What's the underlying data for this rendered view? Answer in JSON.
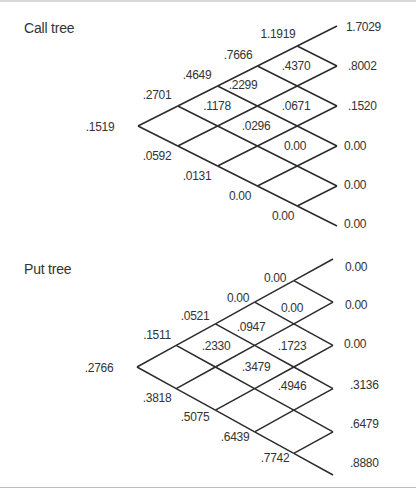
{
  "call_tree": {
    "title": "Call tree",
    "title_pos": {
      "x": 24,
      "y": 20
    },
    "geometry": {
      "root_x": 138,
      "root_y": 126,
      "dx": 39.8,
      "dy": 20,
      "steps": 5
    },
    "labels": [
      {
        "text": ".1519",
        "x": 100,
        "y": 131,
        "anchor": "middle"
      },
      {
        "text": ".2701",
        "x": 157,
        "y": 99,
        "anchor": "middle"
      },
      {
        "text": ".0592",
        "x": 157,
        "y": 160,
        "anchor": "middle"
      },
      {
        "text": ".4649",
        "x": 197,
        "y": 79,
        "anchor": "middle"
      },
      {
        "text": ".1178",
        "x": 217,
        "y": 110,
        "anchor": "middle"
      },
      {
        "text": ".0131",
        "x": 197,
        "y": 180,
        "anchor": "middle"
      },
      {
        "text": ".7666",
        "x": 238,
        "y": 59,
        "anchor": "middle"
      },
      {
        "text": ".2299",
        "x": 243,
        "y": 89,
        "anchor": "middle"
      },
      {
        "text": ".0296",
        "x": 256,
        "y": 130,
        "anchor": "middle"
      },
      {
        "text": "0.00",
        "x": 240,
        "y": 200,
        "anchor": "middle"
      },
      {
        "text": "1.1919",
        "x": 278,
        "y": 38,
        "anchor": "middle"
      },
      {
        "text": ".4370",
        "x": 296,
        "y": 70,
        "anchor": "middle"
      },
      {
        "text": ".0671",
        "x": 296,
        "y": 110,
        "anchor": "middle"
      },
      {
        "text": "0.00",
        "x": 295,
        "y": 150,
        "anchor": "middle"
      },
      {
        "text": "0.00",
        "x": 283,
        "y": 220,
        "anchor": "middle"
      }
    ],
    "terminals": [
      {
        "text": "1.7029",
        "x": 346,
        "y": 31
      },
      {
        "text": ".8002",
        "x": 348,
        "y": 70
      },
      {
        "text": ".1520",
        "x": 348,
        "y": 110
      },
      {
        "text": "0.00",
        "x": 344,
        "y": 150
      },
      {
        "text": "0.00",
        "x": 344,
        "y": 189
      },
      {
        "text": "0.00",
        "x": 344,
        "y": 228
      }
    ]
  },
  "put_tree": {
    "title": "Put tree",
    "title_pos": {
      "x": 24,
      "y": 272
    },
    "geometry": {
      "root_x": 137,
      "root_y": 367,
      "dx": 39.2,
      "dy": 21.6,
      "steps": 5
    },
    "labels": [
      {
        "text": ".2766",
        "x": 99,
        "y": 372,
        "anchor": "middle"
      },
      {
        "text": ".1511",
        "x": 157,
        "y": 339,
        "anchor": "middle"
      },
      {
        "text": ".3818",
        "x": 157,
        "y": 402,
        "anchor": "middle"
      },
      {
        "text": ".0521",
        "x": 195,
        "y": 320,
        "anchor": "middle"
      },
      {
        "text": ".2330",
        "x": 216,
        "y": 350,
        "anchor": "middle"
      },
      {
        "text": ".5075",
        "x": 195,
        "y": 421,
        "anchor": "middle"
      },
      {
        "text": "0.00",
        "x": 238,
        "y": 302,
        "anchor": "middle"
      },
      {
        "text": ".0947",
        "x": 251,
        "y": 331,
        "anchor": "middle"
      },
      {
        "text": ".3479",
        "x": 256,
        "y": 371,
        "anchor": "middle"
      },
      {
        "text": ".6439",
        "x": 235,
        "y": 441,
        "anchor": "middle"
      },
      {
        "text": "0.00",
        "x": 275,
        "y": 282,
        "anchor": "middle"
      },
      {
        "text": "0.00",
        "x": 292,
        "y": 312,
        "anchor": "middle"
      },
      {
        "text": ".1723",
        "x": 292,
        "y": 350,
        "anchor": "middle"
      },
      {
        "text": ".4946",
        "x": 292,
        "y": 390,
        "anchor": "middle"
      },
      {
        "text": ".7742",
        "x": 275,
        "y": 462,
        "anchor": "middle"
      }
    ],
    "terminals": [
      {
        "text": "0.00",
        "x": 345,
        "y": 271
      },
      {
        "text": "0.00",
        "x": 345,
        "y": 309
      },
      {
        "text": "0.00",
        "x": 344,
        "y": 348
      },
      {
        "text": ".3136",
        "x": 350,
        "y": 389
      },
      {
        "text": ".6479",
        "x": 350,
        "y": 428
      },
      {
        "text": ".8880",
        "x": 350,
        "y": 467
      }
    ]
  }
}
